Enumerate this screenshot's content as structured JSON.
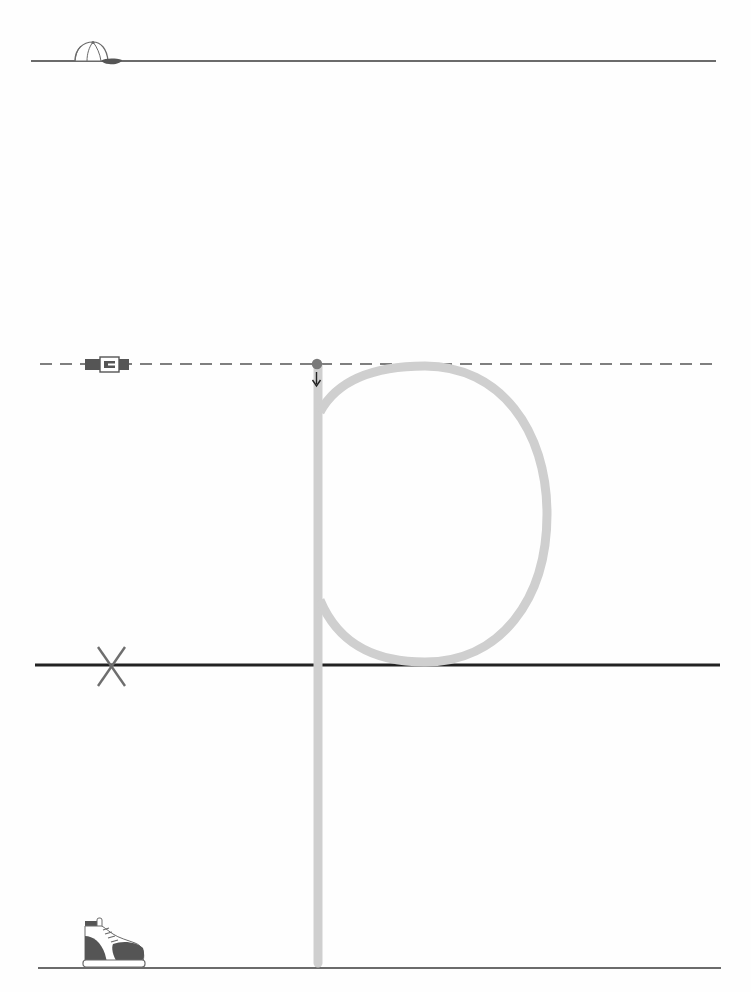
{
  "worksheet": {
    "letter": "p",
    "title": "Letter p handwriting practice",
    "guides": {
      "top_line": {
        "name": "head line",
        "marker": "cap-icon",
        "style": "solid"
      },
      "mid_line": {
        "name": "belt line",
        "marker": "belt-icon",
        "style": "dashed"
      },
      "base_line": {
        "name": "base line",
        "marker": "x-icon",
        "style": "solid-thick"
      },
      "bottom_line": {
        "name": "foot line",
        "marker": "shoe-icon",
        "style": "solid"
      }
    },
    "stroke": {
      "start_marker": "start-dot",
      "direction": "down-arrow-icon",
      "trace_color": "#cfcfcf",
      "dot_color": "#7a7a7a"
    },
    "colors": {
      "line": "#3a3a3a",
      "baseline": "#222222",
      "dash": "#555555",
      "trace": "#cfcfcf",
      "icon_dark": "#555555",
      "x_mark": "#6e6e6e"
    }
  }
}
